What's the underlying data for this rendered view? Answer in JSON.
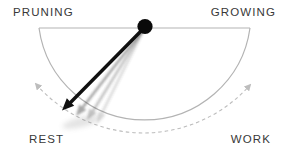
{
  "diagram": {
    "type": "pendulum-swing-diagram",
    "labels": {
      "top_left": "PRUNING",
      "top_right": "GROWING",
      "bottom_left": "REST",
      "bottom_right": "WORK"
    },
    "pendulum_points_to": "REST",
    "swing_arc_ends": [
      "REST",
      "WORK"
    ]
  },
  "icons": {
    "pivot": "pivot-dot",
    "pendulum": "pendulum-arrow",
    "left_swing": "swing-arrowhead-left",
    "right_swing": "swing-arrowhead-right"
  },
  "colors": {
    "bg": "#ffffff",
    "label": "#383838",
    "arc": "#b3b3b3",
    "dashed": "#bdbdbd",
    "arrow": "#101010",
    "trail": "#4a4a4a",
    "pivot": "#0a0a0a"
  }
}
